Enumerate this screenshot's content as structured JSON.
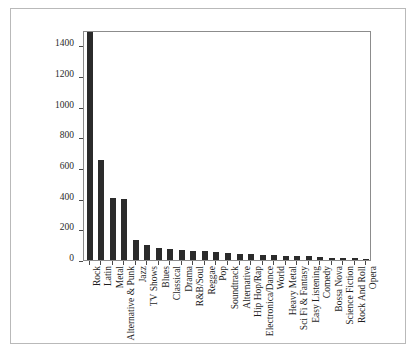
{
  "chart_data": {
    "type": "bar",
    "title": "",
    "subtitle": "",
    "xlabel": "",
    "ylabel": "",
    "xlim": [
      0,
      25
    ],
    "ylim": [
      0,
      1500
    ],
    "grid": false,
    "legend": null,
    "orientation": "vertical",
    "bar_color": "#2b2b2b",
    "ytick_labels": [
      "0",
      "200",
      "400",
      "600",
      "800",
      "1000",
      "1200",
      "1400"
    ],
    "ytick_values": [
      0,
      200,
      400,
      600,
      800,
      1000,
      1200,
      1400
    ],
    "categories": [
      "Rock",
      "Latin",
      "Metal",
      "Alternative & Punk",
      "Jazz",
      "TV Shows",
      "Blues",
      "Classical",
      "Drama",
      "R&B/Soul",
      "Reggae",
      "Pop",
      "Soundtrack",
      "Alternative",
      "Hip Hop/Rap",
      "Electronica/Dance",
      "World",
      "Heavy Metal",
      "Sci Fi & Fantasy",
      "Easy Listening",
      "Comedy",
      "Bossa Nova",
      "Science Fiction",
      "Rock And Roll",
      "Opera"
    ],
    "values": [
      1490,
      655,
      405,
      395,
      130,
      100,
      80,
      75,
      64,
      60,
      58,
      50,
      45,
      42,
      38,
      33,
      30,
      28,
      26,
      24,
      17,
      15,
      13,
      12,
      5
    ]
  },
  "figure": {
    "frame_color": "#b9b9b9",
    "axes_color": "#8c8c8c",
    "background": "#ffffff"
  }
}
